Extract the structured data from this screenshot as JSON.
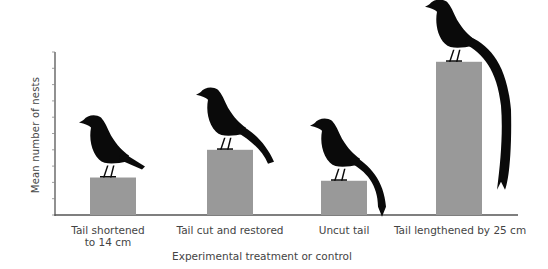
{
  "chart_data": {
    "type": "bar",
    "title": "",
    "xlabel": "Experimental treatment or control",
    "ylabel": "Mean number of nests",
    "categories": [
      "Tail shortened\nto 14 cm",
      "Tail cut and restored",
      "Uncut tail",
      "Tail lengthened by 25 cm"
    ],
    "values": [
      2.3,
      4.0,
      2.1,
      9.4
    ],
    "ylim": [
      0,
      10
    ],
    "yticks_count": 11,
    "ytick_labels_shown": false,
    "grid": false,
    "legend": null,
    "bar_color": "#999999",
    "annotations": [
      "bird silhouettes perched on bars, tail lengths vary by treatment"
    ]
  },
  "colors": {
    "bar": "#999999",
    "axis": "#555555",
    "bird": "#0a0a0a",
    "text": "#444444"
  },
  "bird_tails": [
    "short",
    "medium",
    "medium-long",
    "very-long"
  ]
}
